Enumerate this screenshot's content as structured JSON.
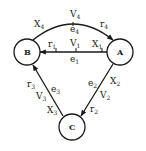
{
  "diagram": {
    "type": "directed-graph",
    "nodes": [
      {
        "id": "A",
        "label": "A",
        "cx": 120,
        "cy": 52
      },
      {
        "id": "B",
        "label": "B",
        "cx": 27,
        "cy": 52
      },
      {
        "id": "C",
        "label": "C",
        "cx": 72,
        "cy": 127
      }
    ],
    "edges": [
      {
        "id": "e1",
        "from": "A",
        "to": "B",
        "name": "e",
        "name_sub": "1",
        "labels": {
          "r": "r",
          "r_sub": "1",
          "v": "V",
          "v_sub": "1",
          "x": "X",
          "x_sub": "1"
        }
      },
      {
        "id": "e2",
        "from": "A",
        "to": "C",
        "name": "e",
        "name_sub": "2",
        "labels": {
          "r": "r",
          "r_sub": "2",
          "v": "V",
          "v_sub": "2",
          "x": "X",
          "x_sub": "2"
        }
      },
      {
        "id": "e3",
        "from": "C",
        "to": "B",
        "name": "e",
        "name_sub": "3",
        "labels": {
          "r": "r",
          "r_sub": "3",
          "v": "V",
          "v_sub": "3",
          "x": "X",
          "x_sub": "3"
        }
      },
      {
        "id": "e4",
        "from": "B",
        "to": "A",
        "name": "e",
        "name_sub": "4",
        "labels": {
          "r": "r",
          "r_sub": "4",
          "v": "V",
          "v_sub": "4",
          "x": "X",
          "x_sub": "4"
        }
      }
    ],
    "colors": {
      "stroke": "#1a1a1a",
      "background": "#ffffff"
    }
  }
}
